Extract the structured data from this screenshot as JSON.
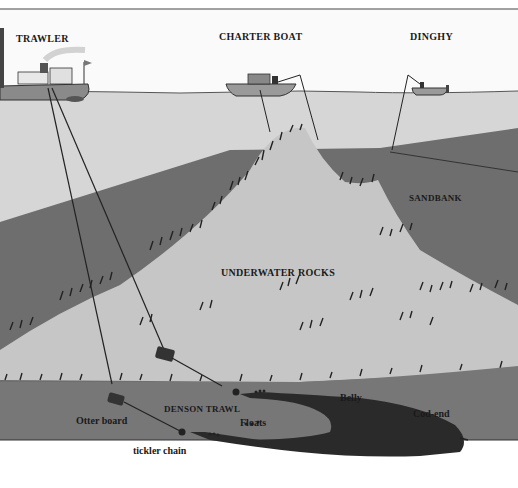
{
  "diagram": {
    "labels": {
      "trawler": "TRAWLER",
      "charter_boat": "CHARTER BOAT",
      "dinghy": "DINGHY",
      "sandbank": "SANDBANK",
      "underwater_rocks": "UNDERWATER ROCKS",
      "denson_trawl": "DENSON TRAWL",
      "otter_board": "Otter board",
      "tickler_chain": "tickler chain",
      "floats": "Floats",
      "belly": "Belly",
      "cod_end": "Cod-end"
    },
    "colors": {
      "sky": "#fafafa",
      "water_surface": "#d9d9d9",
      "shallow_water": "#cfcfcf",
      "sandbank": "#6e6e6e",
      "rocks": "#c4c4c4",
      "seabed": "#767676",
      "net": "#2a2a2a",
      "ink": "#1a1a1a"
    }
  }
}
